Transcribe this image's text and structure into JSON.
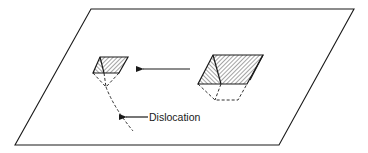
{
  "figure": {
    "type": "schematic diagram",
    "labels": {
      "dislocation": "Dislocation"
    },
    "elements": [
      {
        "name": "surface-plane",
        "description": "parallelogram representing crystal surface"
      },
      {
        "name": "small-etch-pit",
        "description": "small hatched inverted pyramid located at the dislocation outcrop"
      },
      {
        "name": "large-etch-pit",
        "description": "large hatched inverted pyramid away from the dislocation"
      },
      {
        "name": "migration-arrow",
        "description": "arrow pointing from large pit toward small pit"
      },
      {
        "name": "dislocation-line",
        "description": "dashed line descending from small pit apex into the crystal"
      }
    ],
    "colors": {
      "ink": "#1a1a1a",
      "background": "#ffffff"
    }
  }
}
